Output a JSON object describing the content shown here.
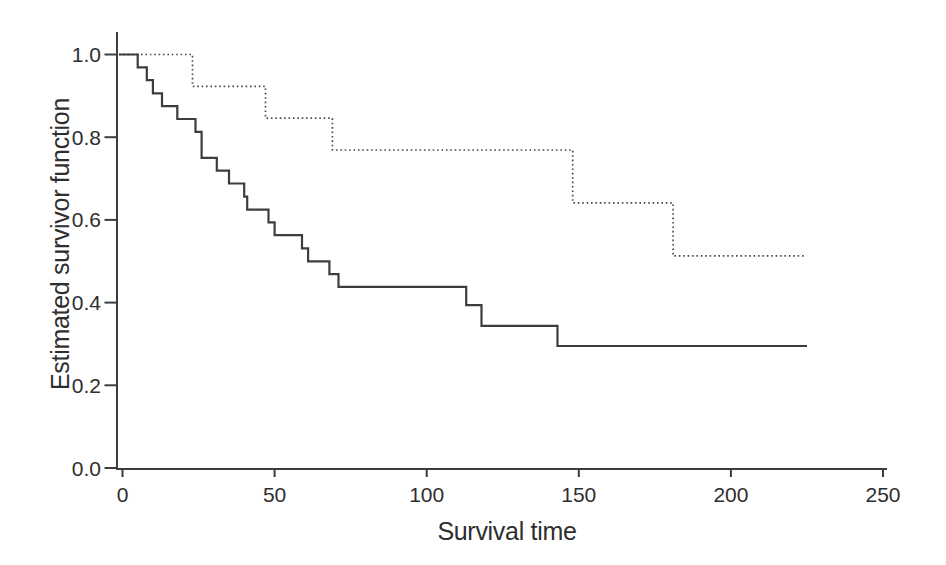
{
  "figure": {
    "background": "#ffffff"
  },
  "chart_data": {
    "type": "line",
    "subtype": "step-survival-curves",
    "title": "",
    "xlabel": "Survival time",
    "ylabel": "Estimated survivor function",
    "xlim": [
      0,
      250
    ],
    "ylim": [
      0.0,
      1.0
    ],
    "x_ticks": [
      0,
      50,
      100,
      150,
      200,
      250
    ],
    "y_tick_labels": [
      "0.0",
      "0.2",
      "0.4",
      "0.6",
      "0.8",
      "1.0"
    ],
    "grid": false,
    "legend": "none",
    "axis_color": "#3d3d3d",
    "series": [
      {
        "name": "upper-dotted-curve",
        "style": "dotted",
        "color": "#4a4a4a",
        "steps": [
          [
            0,
            1.0
          ],
          [
            23,
            0.923
          ],
          [
            47,
            0.846
          ],
          [
            69,
            0.769
          ],
          [
            148,
            0.641
          ],
          [
            181,
            0.513
          ]
        ],
        "end_x": 224
      },
      {
        "name": "lower-solid-curve",
        "style": "solid",
        "color": "#3d3d3d",
        "steps": [
          [
            0,
            1.0
          ],
          [
            5,
            0.969
          ],
          [
            8,
            0.938
          ],
          [
            10,
            0.906
          ],
          [
            13,
            0.875
          ],
          [
            18,
            0.844
          ],
          [
            24,
            0.813
          ],
          [
            26,
            0.75
          ],
          [
            31,
            0.719
          ],
          [
            35,
            0.688
          ],
          [
            40,
            0.656
          ],
          [
            41,
            0.625
          ],
          [
            48,
            0.594
          ],
          [
            50,
            0.563
          ],
          [
            59,
            0.531
          ],
          [
            61,
            0.5
          ],
          [
            68,
            0.469
          ],
          [
            71,
            0.438
          ],
          [
            113,
            0.394
          ],
          [
            118,
            0.344
          ],
          [
            143,
            0.295
          ]
        ],
        "end_x": 225
      }
    ]
  }
}
